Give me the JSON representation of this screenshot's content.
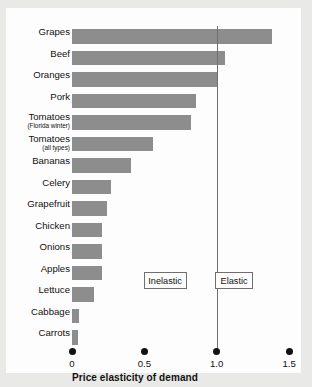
{
  "chart_data": {
    "type": "bar",
    "orientation": "horizontal",
    "title": "",
    "xlabel": "Price elasticity of demand",
    "ylabel": "",
    "xlim": [
      0,
      1.5
    ],
    "xticks": [
      "0",
      "0.5",
      "1.0",
      "1.5"
    ],
    "xtick_values": [
      0,
      0.5,
      1.0,
      1.5
    ],
    "grid": false,
    "legend": null,
    "bar_color": "#8d8d8d",
    "reference_line": {
      "value": 1.0,
      "label": "unit elastic"
    },
    "annotations": [
      {
        "name": "inelastic",
        "label": "Inelastic",
        "x": 0.64
      },
      {
        "name": "elastic",
        "label": "Elastic",
        "x": 1.12
      }
    ],
    "categories": [
      "Grapes",
      "Beef",
      "Oranges",
      "Pork",
      "Tomatoes (Florida winter)",
      "Tomatoes (all types)",
      "Bananas",
      "Celery",
      "Grapefruit",
      "Chicken",
      "Onions",
      "Apples",
      "Lettuce",
      "Cabbage",
      "Carrots"
    ],
    "values": [
      1.38,
      1.06,
      1.0,
      0.86,
      0.82,
      0.56,
      0.41,
      0.27,
      0.24,
      0.21,
      0.21,
      0.21,
      0.15,
      0.05,
      0.04
    ]
  },
  "rows": [
    {
      "label": "Grapes",
      "sub": "",
      "value": 1.38
    },
    {
      "label": "Beef",
      "sub": "",
      "value": 1.06
    },
    {
      "label": "Oranges",
      "sub": "",
      "value": 1.0
    },
    {
      "label": "Pork",
      "sub": "",
      "value": 0.86
    },
    {
      "label": "Tomatoes",
      "sub": "(Florida winter)",
      "value": 0.82
    },
    {
      "label": "Tomatoes",
      "sub": "(all types)",
      "value": 0.56
    },
    {
      "label": "Bananas",
      "sub": "",
      "value": 0.41
    },
    {
      "label": "Celery",
      "sub": "",
      "value": 0.27
    },
    {
      "label": "Grapefruit",
      "sub": "",
      "value": 0.24
    },
    {
      "label": "Chicken",
      "sub": "",
      "value": 0.21
    },
    {
      "label": "Onions",
      "sub": "",
      "value": 0.21
    },
    {
      "label": "Apples",
      "sub": "",
      "value": 0.21
    },
    {
      "label": "Lettuce",
      "sub": "",
      "value": 0.15
    },
    {
      "label": "Cabbage",
      "sub": "",
      "value": 0.05
    },
    {
      "label": "Carrots",
      "sub": "",
      "value": 0.04
    }
  ],
  "axis": {
    "title": "Price elasticity of demand",
    "ticks": [
      {
        "label": "0",
        "value": 0
      },
      {
        "label": "0.5",
        "value": 0.5
      },
      {
        "label": "1.0",
        "value": 1.0
      },
      {
        "label": "1.5",
        "value": 1.5
      }
    ]
  },
  "zones": {
    "inelastic_label": "Inelastic",
    "elastic_label": "Elastic"
  }
}
